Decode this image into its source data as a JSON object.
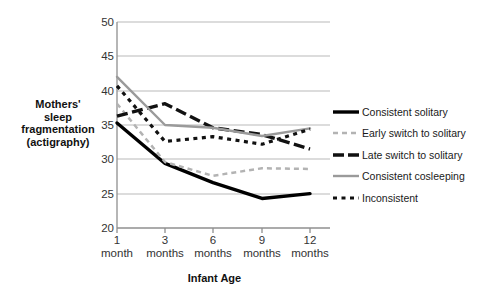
{
  "chart_data": {
    "type": "line",
    "title": "",
    "xlabel": "Infant Age",
    "ylabel": "Mothers' sleep fragmentation (actigraphy)",
    "ylabel_lines": [
      "Mothers'",
      "sleep",
      "fragmentation",
      "(actigraphy)"
    ],
    "categories": [
      "1 month",
      "3 months",
      "6 months",
      "9 months",
      "12 months"
    ],
    "category_lines": [
      {
        "num": "1",
        "unit": "month"
      },
      {
        "num": "3",
        "unit": "months"
      },
      {
        "num": "6",
        "unit": "months"
      },
      {
        "num": "9",
        "unit": "months"
      },
      {
        "num": "12",
        "unit": "months"
      }
    ],
    "ylim": [
      20,
      50
    ],
    "yticks": [
      20,
      25,
      30,
      35,
      40,
      45,
      50
    ],
    "grid": true,
    "legend_position": "right",
    "series": [
      {
        "name": "Consistent solitary",
        "style": "solid-thick-black",
        "color": "#000000",
        "values": [
          35.3,
          29.4,
          26.6,
          24.3,
          25.0
        ]
      },
      {
        "name": "Early switch to solitary",
        "style": "dashed-gray",
        "color": "#b3b3b3",
        "values": [
          38.1,
          29.6,
          27.6,
          28.7,
          28.6
        ]
      },
      {
        "name": "Late switch to solitary",
        "style": "dashed-thick-black",
        "color": "#111111",
        "values": [
          36.3,
          38.1,
          34.6,
          33.6,
          31.5
        ]
      },
      {
        "name": "Consistent cosleeping",
        "style": "solid-gray",
        "color": "#9a9a9a",
        "values": [
          42.0,
          35.0,
          34.6,
          33.4,
          34.5
        ]
      },
      {
        "name": "Inconsistent",
        "style": "dotted-black",
        "color": "#111111",
        "values": [
          40.7,
          32.6,
          33.3,
          32.2,
          34.4
        ]
      }
    ]
  },
  "legend": {
    "items": [
      {
        "label": "Consistent solitary"
      },
      {
        "label": "Early switch to solitary"
      },
      {
        "label": "Late switch to solitary"
      },
      {
        "label": "Consistent cosleeping"
      },
      {
        "label": "Inconsistent"
      }
    ]
  }
}
